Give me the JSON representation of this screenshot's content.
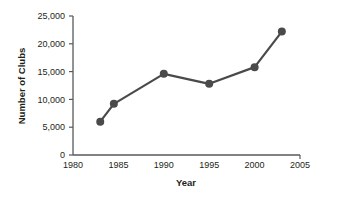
{
  "chart_data": {
    "type": "line",
    "title": "",
    "xlabel": "Year",
    "ylabel": "Number of Clubs",
    "x": [
      1983,
      1984.5,
      1990,
      1995,
      2000,
      2003
    ],
    "values": [
      6000,
      9200,
      14600,
      12800,
      15800,
      22200
    ],
    "series": [
      {
        "name": "Number of Clubs",
        "x": [
          1983,
          1984.5,
          1990,
          1995,
          2000,
          2003
        ],
        "values": [
          6000,
          9200,
          14600,
          12800,
          15800,
          22200
        ]
      }
    ],
    "xlim": [
      1980,
      2005
    ],
    "ylim": [
      0,
      25000
    ],
    "xticks": [
      1980,
      1985,
      1990,
      1995,
      2000,
      2005
    ],
    "xticklabels": [
      "1980",
      "1985",
      "1990",
      "1995",
      "2000",
      "2005"
    ],
    "yticks": [
      0,
      5000,
      10000,
      15000,
      20000,
      25000
    ],
    "yticklabels": [
      "0",
      "5,000",
      "10,000",
      "15,000",
      "20,000",
      "25,000"
    ],
    "grid": false,
    "legend": "none",
    "line_color": "#4a4a4a",
    "marker_color": "#4a4a4a",
    "axis_color": "#58595b",
    "text_color": "#231f20",
    "marker": "circle",
    "marker_size": 4,
    "line_width": 2.2
  },
  "axes": {
    "x_title": "Year",
    "y_title": "Number of Clubs"
  }
}
